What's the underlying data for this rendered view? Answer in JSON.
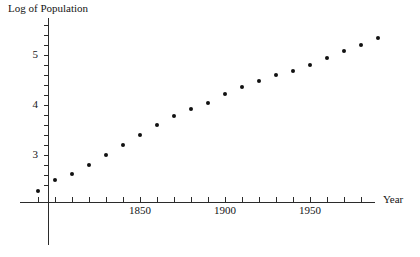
{
  "chart_data": {
    "type": "scatter",
    "title": "",
    "xlabel": "Year",
    "ylabel": "Log of Population",
    "xlim": [
      1600,
      2000
    ],
    "ylim": [
      1.8,
      5.8
    ],
    "grid": false,
    "legend": null,
    "x_ticks_labeled": [
      1850,
      1900,
      1950
    ],
    "x_tick_labels": [
      "1850",
      "1900",
      "1950"
    ],
    "y_ticks_labeled": [
      3,
      4,
      5
    ],
    "y_tick_labels": [
      "3",
      "4",
      "5"
    ],
    "x_tick_step_minor": 10,
    "y_tick_step_minor": 0.2,
    "points": [
      {
        "x": 1610,
        "y": 2.0
      },
      {
        "x": 1790,
        "y": 2.28
      },
      {
        "x": 1800,
        "y": 2.5
      },
      {
        "x": 1810,
        "y": 2.62
      },
      {
        "x": 1820,
        "y": 2.8
      },
      {
        "x": 1830,
        "y": 3.0
      },
      {
        "x": 1840,
        "y": 3.2
      },
      {
        "x": 1850,
        "y": 3.4
      },
      {
        "x": 1860,
        "y": 3.6
      },
      {
        "x": 1870,
        "y": 3.78
      },
      {
        "x": 1880,
        "y": 3.92
      },
      {
        "x": 1890,
        "y": 4.05
      },
      {
        "x": 1900,
        "y": 4.22
      },
      {
        "x": 1910,
        "y": 4.36
      },
      {
        "x": 1920,
        "y": 4.48
      },
      {
        "x": 1930,
        "y": 4.6
      },
      {
        "x": 1940,
        "y": 4.68
      },
      {
        "x": 1950,
        "y": 4.8
      },
      {
        "x": 1960,
        "y": 4.95
      },
      {
        "x": 1970,
        "y": 5.08
      },
      {
        "x": 1980,
        "y": 5.2
      },
      {
        "x": 1990,
        "y": 5.35
      }
    ],
    "colors": {
      "point": "#111111",
      "axis": "#2b2b2b",
      "text": "#141414",
      "background": "#ffffff"
    }
  }
}
